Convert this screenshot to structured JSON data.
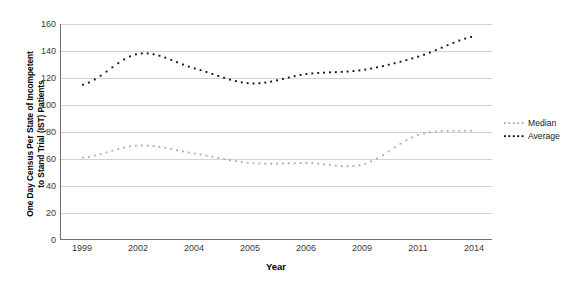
{
  "chart_data": {
    "type": "line",
    "title": "",
    "xlabel": "Year",
    "ylabel": "One Day Census Per State of Incompetent to Stand Trial (IST) Patients",
    "ylabel_line1": "One Day Census Per State of Incompetent",
    "ylabel_line2": "to Stand Trial (IST) Patients",
    "categories": [
      "1999",
      "2002",
      "2004",
      "2005",
      "2006",
      "2009",
      "2011",
      "2014"
    ],
    "x": [
      1999,
      2002,
      2004,
      2005,
      2006,
      2009,
      2011,
      2014
    ],
    "ylim": [
      0,
      160
    ],
    "yticks": [
      0,
      20,
      40,
      60,
      80,
      100,
      120,
      140,
      160
    ],
    "ytick_labels": [
      "0",
      "20",
      "40",
      "60",
      "80",
      "100",
      "120",
      "140",
      "160"
    ],
    "grid": true,
    "legend_position": "right",
    "line_style": "dotted",
    "series": [
      {
        "name": "Median",
        "color": "#b0b0b0",
        "values": [
          61,
          70,
          64,
          57,
          57,
          56,
          78,
          81
        ]
      },
      {
        "name": "Average",
        "color": "#111111",
        "values": [
          115,
          138,
          127,
          116,
          123,
          126,
          136,
          151
        ]
      }
    ]
  },
  "legend": {
    "items": [
      {
        "label": "Median",
        "color": "#b0b0b0"
      },
      {
        "label": "Average",
        "color": "#111111"
      }
    ]
  }
}
